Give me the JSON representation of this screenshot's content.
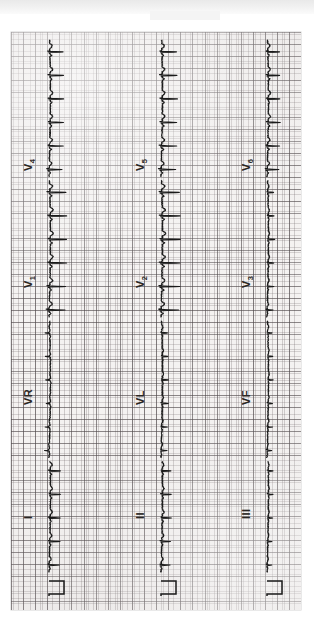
{
  "document": {
    "kind": "12-lead electrocardiogram printout",
    "orientation": "paper rotated 90 degrees; time axis runs bottom-to-top",
    "paper": {
      "background_color": "#f4f2f1",
      "fine_grid_color": "#766e70",
      "bold_grid_color": "#4e484a",
      "fine_grid_mm": 1,
      "bold_grid_mm": 5
    },
    "trace_color": "#1a1a1a",
    "top_band_color": "#ededed"
  },
  "settings": {
    "paper_speed": "25 mm/s",
    "gain": "10 mm/mV",
    "calibration_pulse": "1 mV"
  },
  "columns": [
    {
      "name": "column-left",
      "x": 38,
      "leads": [
        {
          "id": "I",
          "label": "I",
          "sub": "",
          "label_y": 487
        },
        {
          "id": "VR",
          "label": "VR",
          "sub": "",
          "label_y": 373
        },
        {
          "id": "V1",
          "label": "V",
          "sub": "1",
          "label_y": 256
        },
        {
          "id": "V4",
          "label": "V",
          "sub": "4",
          "label_y": 139
        }
      ]
    },
    {
      "name": "column-middle",
      "x": 150,
      "leads": [
        {
          "id": "II",
          "label": "II",
          "sub": "",
          "label_y": 487
        },
        {
          "id": "VL",
          "label": "VL",
          "sub": "",
          "label_y": 373
        },
        {
          "id": "V2",
          "label": "V",
          "sub": "2",
          "label_y": 256
        },
        {
          "id": "V5",
          "label": "V",
          "sub": "5",
          "label_y": 139
        }
      ]
    },
    {
      "name": "column-right",
      "x": 256,
      "leads": [
        {
          "id": "III",
          "label": "III",
          "sub": "",
          "label_y": 487
        },
        {
          "id": "VF",
          "label": "VF",
          "sub": "",
          "label_y": 373
        },
        {
          "id": "V3",
          "label": "V",
          "sub": "3",
          "label_y": 256
        },
        {
          "id": "V6",
          "label": "V",
          "sub": "6",
          "label_y": 139
        }
      ]
    }
  ],
  "chart_data": {
    "type": "line",
    "xlabel": "Time (25 mm/s)",
    "ylabel": "Amplitude (10 mm/mV)",
    "grid": true,
    "legend_position": "inline lead labels",
    "series": [
      {
        "name": "I",
        "column": "left",
        "beats": 9,
        "qrs_polarity": "positive",
        "r_amplitude_mm": 7
      },
      {
        "name": "VR",
        "column": "left",
        "beats": 9,
        "qrs_polarity": "negative",
        "r_amplitude_mm": 3
      },
      {
        "name": "V1",
        "column": "left",
        "beats": 9,
        "qrs_polarity": "positive",
        "r_amplitude_mm": 11
      },
      {
        "name": "V4",
        "column": "left",
        "beats": 9,
        "qrs_polarity": "positive",
        "r_amplitude_mm": 9
      },
      {
        "name": "II",
        "column": "middle",
        "beats": 9,
        "qrs_polarity": "positive",
        "r_amplitude_mm": 6
      },
      {
        "name": "VL",
        "column": "middle",
        "beats": 9,
        "qrs_polarity": "positive",
        "r_amplitude_mm": 4
      },
      {
        "name": "V2",
        "column": "middle",
        "beats": 9,
        "qrs_polarity": "positive",
        "r_amplitude_mm": 12
      },
      {
        "name": "V5",
        "column": "middle",
        "beats": 9,
        "qrs_polarity": "positive",
        "r_amplitude_mm": 10
      },
      {
        "name": "III",
        "column": "right",
        "beats": 9,
        "qrs_polarity": "low",
        "r_amplitude_mm": 3
      },
      {
        "name": "VF",
        "column": "right",
        "beats": 9,
        "qrs_polarity": "low",
        "r_amplitude_mm": 3
      },
      {
        "name": "V3",
        "column": "right",
        "beats": 9,
        "qrs_polarity": "low",
        "r_amplitude_mm": 4
      },
      {
        "name": "V6",
        "column": "right",
        "beats": 9,
        "qrs_polarity": "positive",
        "r_amplitude_mm": 8
      }
    ]
  }
}
